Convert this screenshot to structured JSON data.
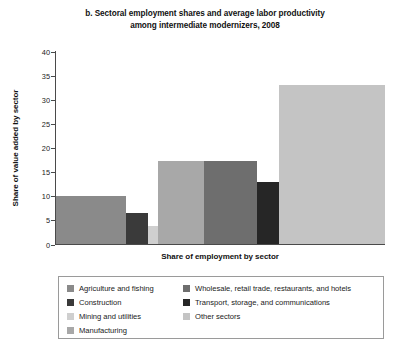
{
  "title": {
    "line1": "b. Sectoral employment shares and average labor productivity",
    "line2": "among intermediate modernizers, 2008"
  },
  "axes": {
    "ylabel": "Share of value added by sector",
    "xlabel": "Share of employment by sector",
    "yticks": [
      "0",
      "5",
      "10",
      "15",
      "20",
      "25",
      "30",
      "35",
      "40"
    ]
  },
  "legend": {
    "column1": [
      {
        "label": "Agriculture and fishing",
        "color": "#8a8a8a"
      },
      {
        "label": "Construction",
        "color": "#3a3a3a"
      },
      {
        "label": "Mining and utilities",
        "color": "#cfcfcf"
      },
      {
        "label": "Manufacturing",
        "color": "#a8a8a8"
      }
    ],
    "column2": [
      {
        "label": "Wholesale, retail trade, restaurants, and hotels",
        "color": "#6e6e6e"
      },
      {
        "label": "Transport, storage, and communications",
        "color": "#262626"
      },
      {
        "label": "Other sectors",
        "color": "#c4c4c4"
      }
    ]
  },
  "chart_data": {
    "type": "bar",
    "title": "b. Sectoral employment shares and average labor productivity among intermediate modernizers, 2008",
    "xlabel": "Share of employment by sector",
    "ylabel": "Share of value added by sector",
    "ylim": [
      0,
      40
    ],
    "ytick_step": 5,
    "grid": false,
    "legend_position": "bottom",
    "note": "Variable-width (Marimekko-style) bar chart: bar width encodes share of employment, bar height encodes share of value added.",
    "categories": [
      "Agriculture and fishing",
      "Construction",
      "Mining and utilities",
      "Manufacturing",
      "Wholesale, retail trade, restaurants, and hotels",
      "Transport, storage, and communications",
      "Other sectors"
    ],
    "values": [
      10.0,
      6.5,
      3.7,
      17.2,
      17.2,
      12.8,
      33.0
    ],
    "widths": [
      21.2,
      6.7,
      3.0,
      14.2,
      16.1,
      6.7,
      32.1
    ],
    "colors": [
      "#8a8a8a",
      "#3a3a3a",
      "#cfcfcf",
      "#a8a8a8",
      "#6e6e6e",
      "#262626",
      "#c4c4c4"
    ]
  }
}
